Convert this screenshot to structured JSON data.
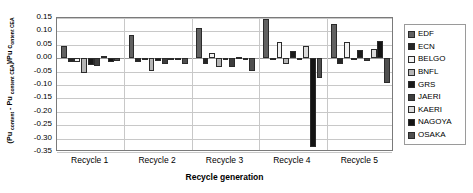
{
  "chart_data": {
    "type": "bar",
    "title": "",
    "xlabel": "Recycle generation",
    "ylabel": "(Pu content - Pu content CEA)/Pu content CEA",
    "categories": [
      "Recycle 1",
      "Recycle 2",
      "Recycle 3",
      "Recycle 4",
      "Recycle 5"
    ],
    "ylim": [
      -0.35,
      0.15
    ],
    "yticks": [
      "0.15",
      "0.10",
      "0.05",
      "0.00",
      "-0.05",
      "-0.10",
      "-0.15",
      "-0.20",
      "-0.25",
      "-0.30",
      "-0.35"
    ],
    "ytick_values": [
      0.15,
      0.1,
      0.05,
      0.0,
      -0.05,
      -0.1,
      -0.15,
      -0.2,
      -0.25,
      -0.3,
      -0.35
    ],
    "grid": true,
    "legend_position": "right",
    "series": [
      {
        "name": "EDF",
        "color": "#616161",
        "values": [
          0.044,
          0.088,
          0.112,
          0.148,
          0.128
        ]
      },
      {
        "name": "ECN",
        "color": "#262626",
        "values": [
          -0.016,
          -0.016,
          -0.02,
          -0.004,
          -0.022
        ]
      },
      {
        "name": "BELGO",
        "color": "#f2f2f2",
        "values": [
          -0.016,
          -0.002,
          0.02,
          0.06,
          0.06
        ]
      },
      {
        "name": "BNFL",
        "color": "#b5b5b5",
        "values": [
          -0.056,
          -0.046,
          -0.032,
          -0.02,
          -0.002
        ]
      },
      {
        "name": "GRS",
        "color": "#1a1a1a",
        "values": [
          -0.026,
          -0.01,
          -0.008,
          0.028,
          0.032
        ]
      },
      {
        "name": "JAERI",
        "color": "#3d3d3d",
        "values": [
          -0.028,
          -0.02,
          -0.032,
          -0.006,
          -0.01
        ]
      },
      {
        "name": "KAERI",
        "color": "#dcdcdc",
        "values": [
          0.01,
          0.002,
          0.006,
          0.044,
          0.034
        ]
      },
      {
        "name": "NAGOYA",
        "color": "#141414",
        "values": [
          -0.016,
          0.002,
          0.002,
          -0.33,
          0.064
        ]
      },
      {
        "name": "OSAKA",
        "color": "#4f4f4f",
        "values": [
          -0.01,
          -0.022,
          -0.046,
          -0.074,
          -0.092
        ]
      }
    ]
  }
}
